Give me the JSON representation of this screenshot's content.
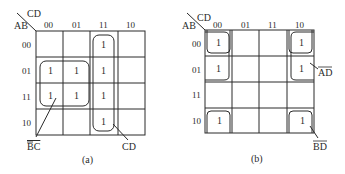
{
  "maps": [
    {
      "caption": "(a)",
      "corner": {
        "col_var": "CD",
        "row_var": "AB"
      },
      "col_headers": [
        "00",
        "01",
        "11",
        "10"
      ],
      "row_headers": [
        "00",
        "01",
        "11",
        "10"
      ],
      "cells": [
        [
          "",
          "",
          "1",
          ""
        ],
        [
          "1",
          "1",
          "1",
          ""
        ],
        [
          "1",
          "1",
          "1",
          ""
        ],
        [
          "",
          "",
          "1",
          ""
        ]
      ],
      "groups": [
        {
          "label": "BC",
          "overbar": "B",
          "cells": "rows 01,11 × cols 00,01"
        },
        {
          "label": "CD",
          "overbar": "",
          "cells": "col 11 all rows"
        }
      ]
    },
    {
      "caption": "(b)",
      "corner": {
        "col_var": "CD",
        "row_var": "AB"
      },
      "col_headers": [
        "00",
        "01",
        "11",
        "10"
      ],
      "row_headers": [
        "00",
        "01",
        "11",
        "10"
      ],
      "cells": [
        [
          "1",
          "",
          "",
          "1"
        ],
        [
          "1",
          "",
          "",
          "1"
        ],
        [
          "",
          "",
          "",
          ""
        ],
        [
          "1",
          "",
          "",
          "1"
        ]
      ],
      "groups": [
        {
          "label": "AD",
          "overbar": "AD",
          "cells": "rows 00,01 × cols 00,10"
        },
        {
          "label": "BD",
          "overbar": "BD",
          "cells": "rows 00,10 × cols 00,10"
        }
      ]
    }
  ],
  "labels": {
    "a_corner_cd": "CD",
    "a_corner_ab": "AB",
    "b_corner_cd": "CD",
    "b_corner_ab": "AB",
    "a_group1": "BC",
    "a_group2": "CD",
    "b_group1": "AD",
    "b_group2": "BD",
    "a_caption": "(a)",
    "b_caption": "(b)",
    "one": "1"
  }
}
